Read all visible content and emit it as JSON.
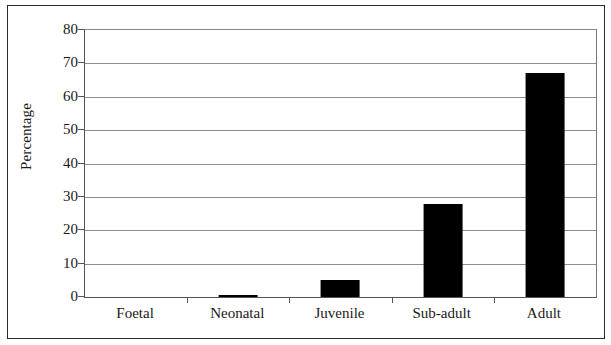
{
  "chart_data": {
    "type": "bar",
    "title": "",
    "subtitle": "",
    "xlabel": "",
    "ylabel": "Percentage",
    "categories": [
      "Foetal",
      "Neonatal",
      "Juvenile",
      "Sub-adult",
      "Adult"
    ],
    "values": [
      0,
      0.5,
      5,
      28,
      67
    ],
    "series": [
      {
        "name": "Percentage",
        "values": [
          0,
          0.5,
          5,
          28,
          67
        ]
      }
    ],
    "ylim": [
      0,
      80
    ],
    "y_ticks": [
      0,
      10,
      20,
      30,
      40,
      50,
      60,
      70,
      80
    ],
    "y_tick_labels": [
      "0",
      "10",
      "20",
      "30",
      "40",
      "50",
      "60",
      "70",
      "80"
    ],
    "grid": true,
    "grid_axis": "y",
    "legend": false,
    "legend_position": "none",
    "bar_color": "#000000",
    "plot_background": "#ffffff",
    "axis_color": "#555555",
    "gridline_color": "#8d8d8d",
    "text_color": "#1a1a1a"
  },
  "frame": {
    "border_color": "#2b2b2b"
  }
}
